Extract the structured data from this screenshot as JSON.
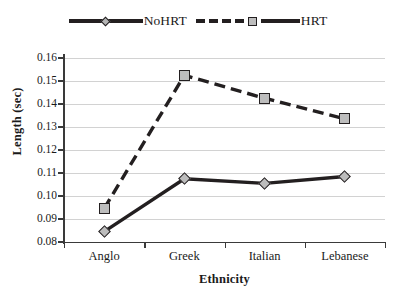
{
  "chart_data": {
    "type": "line",
    "title": "",
    "xlabel": "Ethnicity",
    "ylabel": "Length (sec)",
    "categories": [
      "Anglo",
      "Greek",
      "Italian",
      "Lebanese"
    ],
    "ylim": [
      0.08,
      0.16
    ],
    "ytick_labels": [
      "0.16",
      "0.15",
      "0.14",
      "0.13",
      "0.12",
      "0.11",
      "0.10",
      "0.09",
      "0.08"
    ],
    "ytick_values": [
      0.16,
      0.15,
      0.14,
      0.13,
      0.12,
      0.11,
      0.1,
      0.09,
      0.08
    ],
    "grid": true,
    "legend_position": "top",
    "series": [
      {
        "name": "NoHRT",
        "values": [
          0.0845,
          0.1075,
          0.1055,
          0.1085
        ],
        "line_style": "solid",
        "marker": "diamond",
        "color": "#231f20"
      },
      {
        "name": "HRT",
        "values": [
          0.0945,
          0.1525,
          0.1425,
          0.1335
        ],
        "line_style": "dashed",
        "marker": "square",
        "color": "#231f20"
      }
    ]
  },
  "legend": {
    "entries": [
      {
        "label": "NoHRT",
        "marker": "diamond-marker",
        "line": "solid"
      },
      {
        "label": "HRT",
        "marker": "square-marker",
        "line": "dashed"
      }
    ]
  },
  "colors": {
    "line": "#231f20",
    "marker_fill": "#bdbdbd",
    "grid": "#d2d2d2",
    "axis": "#3a3a3a",
    "text": "#1a1a1a"
  }
}
